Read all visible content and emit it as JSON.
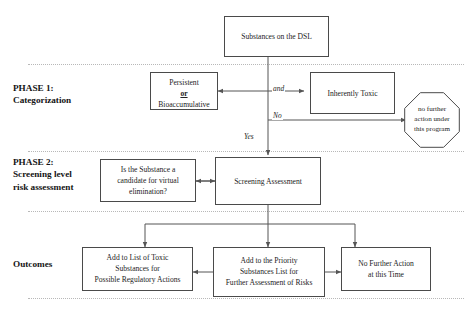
{
  "diagram": {
    "corner_mark": "",
    "phases": [
      {
        "id": "phase1",
        "label": "PHASE 1:\nCategorization"
      },
      {
        "id": "phase2",
        "label": "PHASE 2:\nScreening level\nrisk assessment"
      },
      {
        "id": "outcomes",
        "label": "Outcomes"
      }
    ],
    "nodes": [
      {
        "id": "dsl",
        "shape": "rect",
        "lines": [
          "Substances on the DSL"
        ]
      },
      {
        "id": "persistent",
        "shape": "rect",
        "lines": [
          "Persistent",
          "or",
          "Bioaccumulative"
        ],
        "emphasis_line": 1
      },
      {
        "id": "toxic",
        "shape": "rect",
        "lines": [
          "Inherently Toxic"
        ]
      },
      {
        "id": "nofurther",
        "shape": "octagon",
        "lines": [
          "no",
          "further action",
          "under this",
          "program"
        ]
      },
      {
        "id": "virtual",
        "shape": "rect",
        "lines": [
          "Is the Substance a",
          "candidate for virtual",
          "elimination?"
        ]
      },
      {
        "id": "screening",
        "shape": "rect",
        "lines": [
          "Screening Assessment"
        ]
      },
      {
        "id": "toxiclist",
        "shape": "rect",
        "lines": [
          "Add to List of Toxic",
          "Substances for",
          "Possible Regulatory Actions"
        ]
      },
      {
        "id": "priority",
        "shape": "rect",
        "lines": [
          "Add to the Priority",
          "Substances List for",
          "Further Assessment of Risks"
        ]
      },
      {
        "id": "noaction",
        "shape": "rect",
        "lines": [
          "No Further Action",
          "at this Time"
        ]
      }
    ],
    "edge_labels": [
      {
        "id": "and",
        "text": "and"
      },
      {
        "id": "no",
        "text": "No"
      },
      {
        "id": "yes",
        "text": "Yes"
      }
    ],
    "colors": {
      "box_border": "#4a4a4a",
      "text": "#232323",
      "wire": "#555555",
      "divider": "#b8b8b8",
      "background": "#ffffff"
    }
  }
}
